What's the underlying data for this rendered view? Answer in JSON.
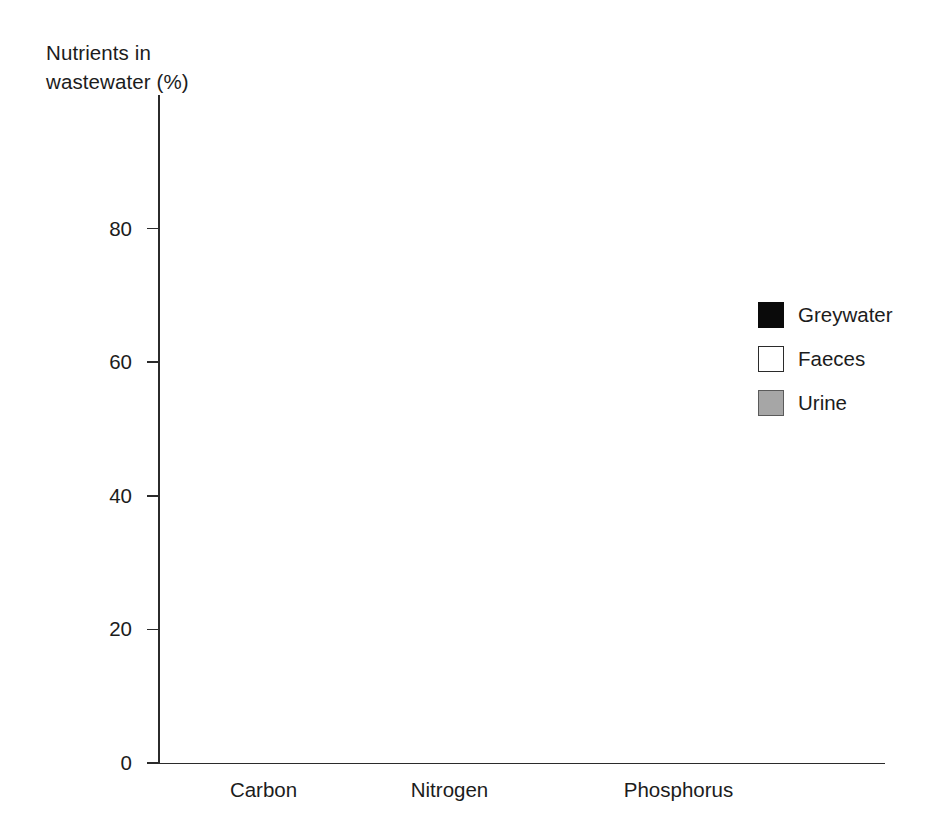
{
  "chart_data": {
    "type": "bar",
    "subtype": "stacked-bar",
    "title": "",
    "subtitle": "",
    "xlabel": "",
    "ylabel": "Nutrients in\nwastewater (%)",
    "categories": [
      "Carbon",
      "Nitrogen",
      "Phosphorus"
    ],
    "series": [
      {
        "name": "Greywater",
        "color": "#0a0a0a",
        "values": [
          60,
          9.5,
          49
        ]
      },
      {
        "name": "Faeces",
        "color": "#ffffff",
        "values": [
          30,
          15,
          20
        ]
      },
      {
        "name": "Urine",
        "color": "#a6a6a6",
        "values": [
          10,
          75.5,
          31
        ]
      }
    ],
    "stack_order_bottom_to_top": [
      "Urine",
      "Faeces",
      "Greywater"
    ],
    "cumulative_tops": {
      "Carbon": {
        "urine": 10,
        "faeces": 40,
        "greywater": 100
      },
      "Nitrogen": {
        "urine": 75.5,
        "faeces": 90.5,
        "greywater": 100
      },
      "Phosphorus": {
        "urine": 31,
        "faeces": 51,
        "greywater": 100
      }
    },
    "ylim": [
      0,
      100
    ],
    "yticks": [
      0,
      20,
      40,
      60,
      80
    ],
    "ytick_labels": [
      "0",
      "20",
      "40",
      "60",
      "80"
    ],
    "grid": false,
    "legend_position": "right",
    "legend_entries": [
      "Greywater",
      "Faeces",
      "Urine"
    ]
  },
  "axis": {
    "y_title": "Nutrients in\nwastewater (%)",
    "ticks": [
      {
        "value": 80,
        "label": "80"
      },
      {
        "value": 60,
        "label": "60"
      },
      {
        "value": 40,
        "label": "40"
      },
      {
        "value": 20,
        "label": "20"
      },
      {
        "value": 0,
        "label": "0"
      }
    ]
  },
  "categories": [
    {
      "label": "Carbon"
    },
    {
      "label": "Nitrogen"
    },
    {
      "label": "Phosphorus"
    }
  ],
  "legend": {
    "items": [
      {
        "label": "Greywater",
        "swatch": "greywater"
      },
      {
        "label": "Faeces",
        "swatch": "faeces"
      },
      {
        "label": "Urine",
        "swatch": "urine"
      }
    ]
  }
}
